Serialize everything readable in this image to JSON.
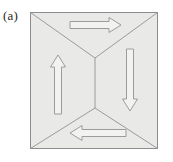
{
  "figure": {
    "panel_label": "(a)",
    "caption_text": "",
    "colors": {
      "background": "#ffffff",
      "domain_fill": "#e9e9e7",
      "outline_stroke": "#8c8c8c",
      "wall_stroke": "#9a9a9a",
      "arrow_stroke": "#9c9c9c",
      "label_text": "#2a2a2a"
    },
    "square": {
      "x": 30,
      "y": 12,
      "width": 128,
      "height": 137
    },
    "vertices": {
      "top_junction": {
        "x": 95,
        "y": 58
      },
      "bottom_junction": {
        "x": 95,
        "y": 108
      }
    },
    "domain_walls": [
      {
        "name": "wall-top-left",
        "from": [
          30,
          12
        ],
        "to": [
          95,
          58
        ]
      },
      {
        "name": "wall-top-right",
        "from": [
          158,
          12
        ],
        "to": [
          95,
          58
        ]
      },
      {
        "name": "wall-center-vertical",
        "from": [
          95,
          58
        ],
        "to": [
          95,
          108
        ]
      },
      {
        "name": "wall-bottom-left",
        "from": [
          30,
          149
        ],
        "to": [
          95,
          108
        ]
      },
      {
        "name": "wall-bottom-right",
        "from": [
          158,
          149
        ],
        "to": [
          95,
          108
        ]
      }
    ],
    "arrows": [
      {
        "name": "arrow-top",
        "direction": "right",
        "label": "→",
        "domain": "top-domain",
        "tail": [
          70,
          25
        ],
        "head": [
          121,
          25
        ]
      },
      {
        "name": "arrow-left",
        "direction": "up",
        "label": "↑",
        "domain": "left-domain",
        "tail": [
          58,
          114
        ],
        "head": [
          58,
          55
        ]
      },
      {
        "name": "arrow-right",
        "direction": "down",
        "label": "↓",
        "domain": "right-domain",
        "tail": [
          130,
          49
        ],
        "head": [
          130,
          111
        ]
      },
      {
        "name": "arrow-bottom",
        "direction": "left",
        "label": "←",
        "domain": "bottom-domain",
        "tail": [
          126,
          133
        ],
        "head": [
          70,
          133
        ]
      }
    ]
  }
}
